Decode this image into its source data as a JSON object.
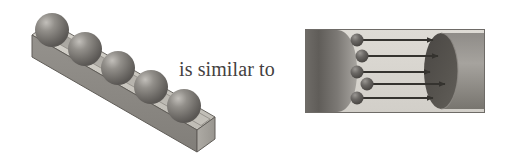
{
  "figure": {
    "caption_text": "is similar to",
    "background_color": "#ffffff",
    "width": 506,
    "height": 164
  },
  "left_diagram": {
    "name": "grooved-bar-with-spheres",
    "description": "Isometric rectangular bar with a channel groove holding a single-file row of spheres",
    "sphere_count": 5,
    "top_face_color": "#c9c6bf",
    "front_face_color": "#8d8a85",
    "end_face_color": "#a5a29c",
    "groove_color": "#b5b2ab",
    "sphere_color": "#7b7874",
    "sphere_highlight_color": "#b9b6b1",
    "outline_color": "#57544f"
  },
  "right_diagram": {
    "name": "tube-with-diffusing-spheres",
    "description": "Cylindrical tube in cross-section with spheres travelling to the right along arrows",
    "sphere_count": 5,
    "arrow_count": 5,
    "arrow_direction": "right",
    "panel_background_color": "#d8d5cf",
    "cylinder_dark_color": "#55524e",
    "cylinder_mid_color": "#7e7b77",
    "cylinder_light_color": "#a3a09b",
    "sphere_color": "#5d5a57",
    "arrow_color": "#3a3835",
    "border_color": "#6e6b67"
  }
}
